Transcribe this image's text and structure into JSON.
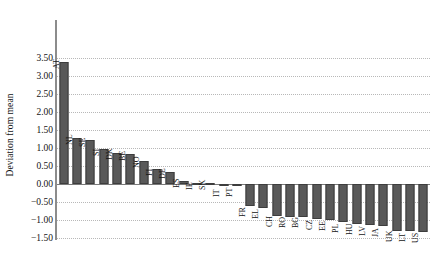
{
  "chart_data": {
    "type": "bar",
    "title": "",
    "subtitle": "",
    "xlabel": "",
    "ylabel": "Deviation from mean",
    "ylim": [
      -1.5,
      3.5
    ],
    "ytick_step": 0.5,
    "ytick_labels": [
      "3.50",
      "3.00",
      "2.50",
      "2.00",
      "1.50",
      "1.00",
      "0.50",
      "0.00",
      "-0.50",
      "-1.00",
      "-1.50"
    ],
    "ytick_values": [
      3.5,
      3.0,
      2.5,
      2.0,
      1.5,
      1.0,
      0.5,
      0.0,
      -0.5,
      -1.0,
      -1.5
    ],
    "grid": true,
    "grid_axis": "y",
    "legend": false,
    "legend_position": "none",
    "bar_color": "#595959",
    "bar_edge_color": "#3d3d3d",
    "axis_color": "#8c8c8c",
    "gridline_color": "#b8b8b8",
    "categories": [
      "AT",
      "NL",
      "SE",
      "SI",
      "DK",
      "BE",
      "NO",
      "FI",
      "DE",
      "ES",
      "IE",
      "SK",
      "IT",
      "PT",
      "FR",
      "EL",
      "CH",
      "RO",
      "BG",
      "CZ",
      "EE",
      "PL",
      "HU",
      "LV",
      "JA",
      "UK",
      "LT",
      "US"
    ],
    "values": [
      3.4,
      1.28,
      1.22,
      0.97,
      0.85,
      0.82,
      0.63,
      0.42,
      0.32,
      0.09,
      0.04,
      0.03,
      -0.04,
      -0.06,
      -0.62,
      -0.68,
      -0.88,
      -0.92,
      -0.92,
      -0.96,
      -1.0,
      -1.06,
      -1.1,
      -1.14,
      -1.18,
      -1.3,
      -1.3,
      -1.32
    ]
  }
}
